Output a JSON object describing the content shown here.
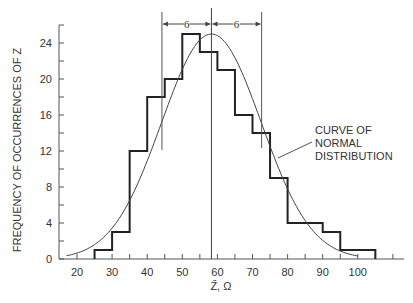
{
  "chart_data": {
    "type": "bar",
    "subtype": "histogram_with_normal_curve",
    "title": "",
    "xlabel": "Z̄, Ω",
    "ylabel": "FREQUENCY OF OCCURRENCES OF Z",
    "xlim": [
      15,
      110
    ],
    "ylim": [
      0,
      26
    ],
    "xticks": [
      20,
      30,
      40,
      50,
      60,
      70,
      80,
      90,
      100
    ],
    "yticks": [
      0,
      4,
      8,
      12,
      16,
      20,
      24
    ],
    "bin_width": 5,
    "bins": [
      {
        "from": 25,
        "to": 30,
        "count": 1
      },
      {
        "from": 30,
        "to": 35,
        "count": 3
      },
      {
        "from": 35,
        "to": 40,
        "count": 12
      },
      {
        "from": 40,
        "to": 45,
        "count": 18
      },
      {
        "from": 45,
        "to": 50,
        "count": 20
      },
      {
        "from": 50,
        "to": 55,
        "count": 25
      },
      {
        "from": 55,
        "to": 60,
        "count": 23
      },
      {
        "from": 60,
        "to": 65,
        "count": 21
      },
      {
        "from": 65,
        "to": 70,
        "count": 16
      },
      {
        "from": 70,
        "to": 75,
        "count": 14
      },
      {
        "from": 75,
        "to": 80,
        "count": 9
      },
      {
        "from": 80,
        "to": 85,
        "count": 4
      },
      {
        "from": 85,
        "to": 90,
        "count": 4
      },
      {
        "from": 90,
        "to": 95,
        "count": 3
      },
      {
        "from": 95,
        "to": 100,
        "count": 1
      },
      {
        "from": 100,
        "to": 105,
        "count": 1
      }
    ],
    "normal_curve": {
      "mean": 58.3,
      "sigma": 14.2,
      "peak": 25
    },
    "annotations": {
      "curve_label": [
        "CURVE OF",
        "NORMAL",
        "DISTRIBUTION"
      ],
      "sigma_left": "6",
      "sigma_right": "6",
      "mean_x": 58.3,
      "minus_sigma_x": 44.2,
      "plus_sigma_x": 72.6
    },
    "grid": false,
    "legend": "none"
  }
}
